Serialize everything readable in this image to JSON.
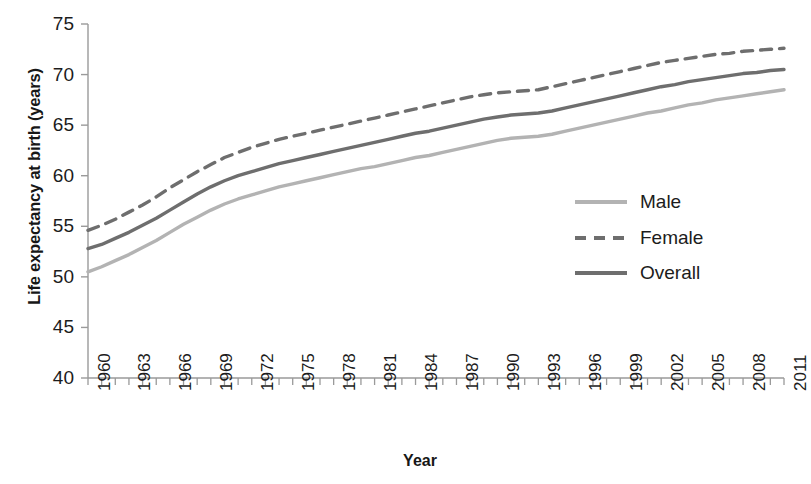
{
  "chart_data": {
    "type": "line",
    "title": "",
    "xlabel": "Year",
    "ylabel": "Life expectancy at birth (years)",
    "xlim": [
      1960,
      2011
    ],
    "ylim": [
      40,
      75
    ],
    "yticks": [
      40,
      45,
      50,
      55,
      60,
      65,
      70,
      75
    ],
    "xticks": [
      1960,
      1963,
      1966,
      1969,
      1972,
      1975,
      1978,
      1981,
      1984,
      1987,
      1990,
      1993,
      1996,
      1999,
      2002,
      2005,
      2008,
      2011
    ],
    "grid": false,
    "legend_position": "center-right",
    "x": [
      1960,
      1961,
      1962,
      1963,
      1964,
      1965,
      1966,
      1967,
      1968,
      1969,
      1970,
      1971,
      1972,
      1973,
      1974,
      1975,
      1976,
      1977,
      1978,
      1979,
      1980,
      1981,
      1982,
      1983,
      1984,
      1985,
      1986,
      1987,
      1988,
      1989,
      1990,
      1991,
      1992,
      1993,
      1994,
      1995,
      1996,
      1997,
      1998,
      1999,
      2000,
      2001,
      2002,
      2003,
      2004,
      2005,
      2006,
      2007,
      2008,
      2009,
      2010,
      2011
    ],
    "series": [
      {
        "name": "Male",
        "color": "#b3b3b3",
        "style": "solid",
        "values": [
          50.5,
          51.0,
          51.6,
          52.2,
          52.9,
          53.6,
          54.4,
          55.2,
          55.9,
          56.6,
          57.2,
          57.7,
          58.1,
          58.5,
          58.9,
          59.2,
          59.5,
          59.8,
          60.1,
          60.4,
          60.7,
          60.9,
          61.2,
          61.5,
          61.8,
          62.0,
          62.3,
          62.6,
          62.9,
          63.2,
          63.5,
          63.7,
          63.8,
          63.9,
          64.1,
          64.4,
          64.7,
          65.0,
          65.3,
          65.6,
          65.9,
          66.2,
          66.4,
          66.7,
          67.0,
          67.2,
          67.5,
          67.7,
          67.9,
          68.1,
          68.3,
          68.5
        ]
      },
      {
        "name": "Female",
        "color": "#6e6e6e",
        "style": "dashed",
        "values": [
          54.6,
          55.1,
          55.7,
          56.4,
          57.1,
          57.9,
          58.8,
          59.6,
          60.4,
          61.1,
          61.8,
          62.3,
          62.8,
          63.2,
          63.6,
          63.9,
          64.2,
          64.5,
          64.8,
          65.1,
          65.4,
          65.7,
          66.0,
          66.3,
          66.6,
          66.9,
          67.2,
          67.5,
          67.8,
          68.0,
          68.2,
          68.3,
          68.4,
          68.5,
          68.8,
          69.1,
          69.4,
          69.7,
          70.0,
          70.3,
          70.6,
          70.9,
          71.2,
          71.4,
          71.6,
          71.8,
          72.0,
          72.1,
          72.3,
          72.4,
          72.5,
          72.6
        ]
      },
      {
        "name": "Overall",
        "color": "#6e6e6e",
        "style": "solid",
        "values": [
          52.8,
          53.2,
          53.8,
          54.4,
          55.1,
          55.8,
          56.6,
          57.4,
          58.2,
          58.9,
          59.5,
          60.0,
          60.4,
          60.8,
          61.2,
          61.5,
          61.8,
          62.1,
          62.4,
          62.7,
          63.0,
          63.3,
          63.6,
          63.9,
          64.2,
          64.4,
          64.7,
          65.0,
          65.3,
          65.6,
          65.8,
          66.0,
          66.1,
          66.2,
          66.4,
          66.7,
          67.0,
          67.3,
          67.6,
          67.9,
          68.2,
          68.5,
          68.8,
          69.0,
          69.3,
          69.5,
          69.7,
          69.9,
          70.1,
          70.2,
          70.4,
          70.5
        ]
      }
    ]
  },
  "legend": {
    "items": [
      {
        "label": "Male"
      },
      {
        "label": "Female"
      },
      {
        "label": "Overall"
      }
    ]
  },
  "axis_colors": {
    "axis_line": "#9a9a9a",
    "tick": "#9a9a9a",
    "text": "#1c1c1c"
  }
}
